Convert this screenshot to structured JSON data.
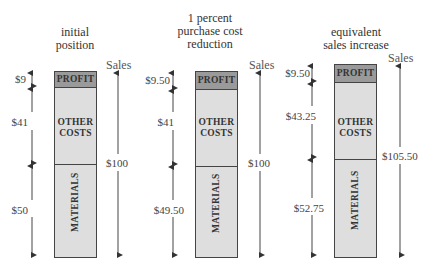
{
  "diagram": {
    "type": "stacked-cost-bars",
    "sales_label": "Sales",
    "segment_labels": {
      "profit": "PROFIT",
      "other": "OTHER COSTS",
      "other_line1": "OTHER",
      "other_line2": "COSTS",
      "materials": "MATERIALS"
    },
    "colors": {
      "profit_fill": "#9a9a9a",
      "cost_fill": "#dedede",
      "outline": "#444444"
    },
    "panels": [
      {
        "title_line1": "initial",
        "title_line2": "position",
        "title_line3": "",
        "profit": "$9",
        "other_costs": "$41",
        "materials": "$50",
        "sales": "$100"
      },
      {
        "title_line1": "1 percent",
        "title_line2": "purchase cost",
        "title_line3": "reduction",
        "profit": "$9.50",
        "other_costs": "$41",
        "materials": "$49.50",
        "sales": "$100"
      },
      {
        "title_line1": "equivalent",
        "title_line2": "sales increase",
        "title_line3": "",
        "profit": "$9.50",
        "other_costs": "$43.25",
        "materials": "$52.75",
        "sales": "$105.50"
      }
    ]
  }
}
